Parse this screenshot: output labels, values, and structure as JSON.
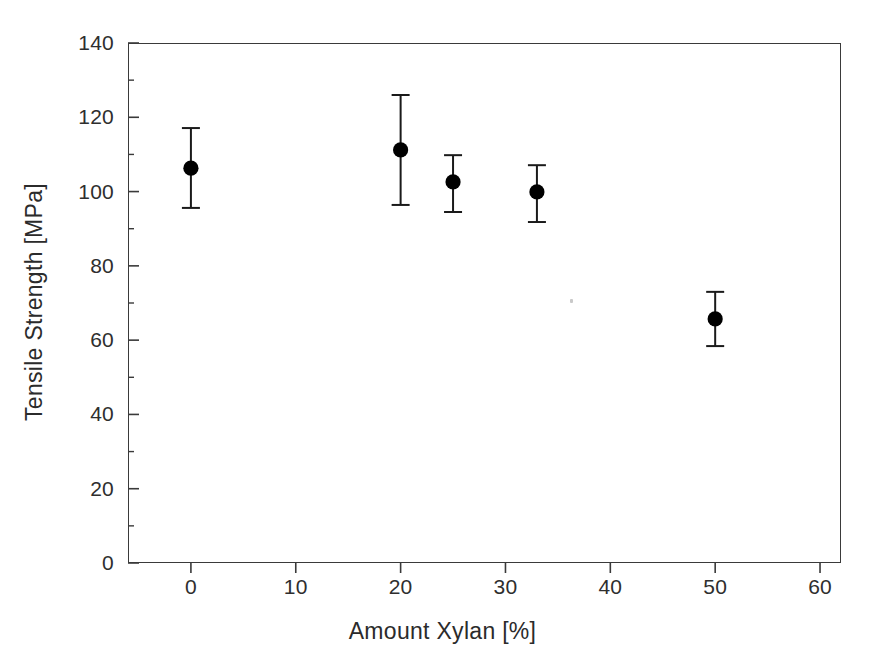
{
  "chart_data": {
    "type": "scatter",
    "title": "",
    "xlabel": "Amount Xylan  [%]",
    "ylabel": "Tensile Strength  [MPa]",
    "xlim": [
      -6,
      62
    ],
    "ylim": [
      0,
      140
    ],
    "grid": false,
    "legend": null,
    "marker": "filled-circle",
    "error_bars": "vertical",
    "x": [
      0,
      20,
      25,
      33,
      50
    ],
    "y": [
      106.3,
      111.2,
      102.6,
      99.9,
      65.7
    ],
    "y_err_upper": [
      117.1,
      126.0,
      109.8,
      107.1,
      73.0
    ],
    "y_err_lower": [
      95.6,
      96.4,
      94.5,
      91.8,
      58.4
    ],
    "points": [
      {
        "x": 0,
        "y": 106.3,
        "hi": 117.1,
        "lo": 95.6
      },
      {
        "x": 20,
        "y": 111.2,
        "hi": 126.0,
        "lo": 96.4
      },
      {
        "x": 25,
        "y": 102.6,
        "hi": 109.8,
        "lo": 94.5
      },
      {
        "x": 33,
        "y": 99.9,
        "hi": 107.1,
        "lo": 91.8
      },
      {
        "x": 50,
        "y": 65.7,
        "hi": 73.0,
        "lo": 58.4
      }
    ],
    "xticks": [
      0,
      10,
      20,
      30,
      40,
      50,
      60
    ],
    "xtick_labels": [
      "0",
      "10",
      "20",
      "30",
      "40",
      "50",
      "60"
    ],
    "yticks": [
      0,
      20,
      40,
      60,
      80,
      100,
      120,
      140
    ],
    "ytick_labels": [
      "0",
      "20",
      "40",
      "60",
      "80",
      "100",
      "120",
      "140"
    ],
    "y_minor_ticks": [
      10,
      30,
      50,
      70,
      90,
      110,
      130
    ],
    "colors": {
      "marker": "#000000",
      "error_bar": "#1a1a1a",
      "axis": "#3a3a3a",
      "text": "#2b2b2b",
      "background": "#ffffff"
    }
  },
  "axes": {
    "x_title": "Amount Xylan  [%]",
    "y_title": "Tensile Strength  [MPa]"
  },
  "ticks": {
    "x": [
      "0",
      "10",
      "20",
      "30",
      "40",
      "50",
      "60"
    ],
    "y": [
      "0",
      "20",
      "40",
      "60",
      "80",
      "100",
      "120",
      "140"
    ]
  }
}
